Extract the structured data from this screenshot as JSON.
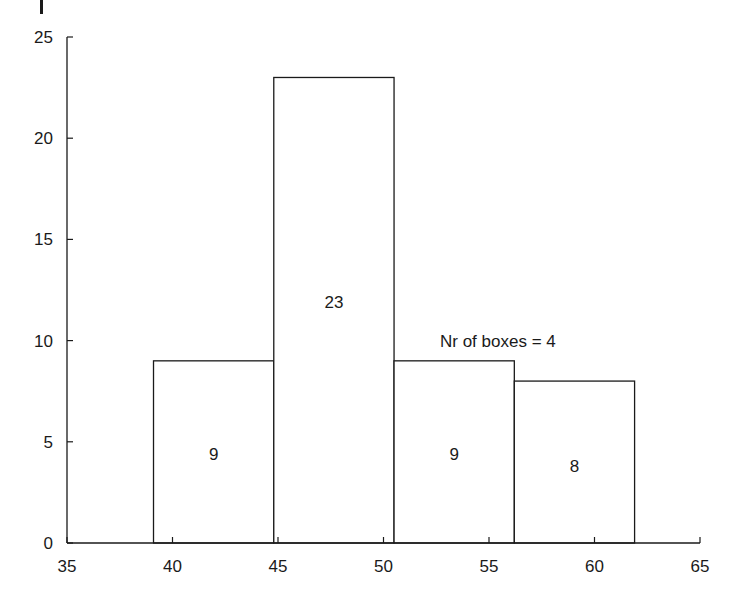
{
  "chart_data": {
    "type": "bar",
    "subtype": "histogram",
    "title": "",
    "xlabel": "",
    "ylabel": "",
    "xlim": [
      35,
      65
    ],
    "ylim": [
      0,
      25
    ],
    "grid": false,
    "legend": null,
    "x_ticks": [
      35,
      40,
      45,
      50,
      55,
      60,
      65
    ],
    "y_ticks": [
      0,
      5,
      10,
      15,
      20,
      25
    ],
    "bins": [
      {
        "left": 39.1,
        "right": 44.8,
        "value": 9,
        "label": "9"
      },
      {
        "left": 44.8,
        "right": 50.5,
        "value": 23,
        "label": "23"
      },
      {
        "left": 50.5,
        "right": 56.2,
        "value": 9,
        "label": "9"
      },
      {
        "left": 56.2,
        "right": 61.9,
        "value": 8,
        "label": "8"
      }
    ],
    "categories": [
      "39.1-44.8",
      "44.8-50.5",
      "50.5-56.2",
      "56.2-61.9"
    ],
    "values": [
      9,
      23,
      9,
      8
    ],
    "annotations": [
      {
        "text": "Nr of boxes = 4",
        "x": 53,
        "y": 10
      }
    ]
  },
  "colors": {
    "line": "#1a1a1a",
    "background": "#ffffff",
    "bar_fill": "#ffffff"
  }
}
